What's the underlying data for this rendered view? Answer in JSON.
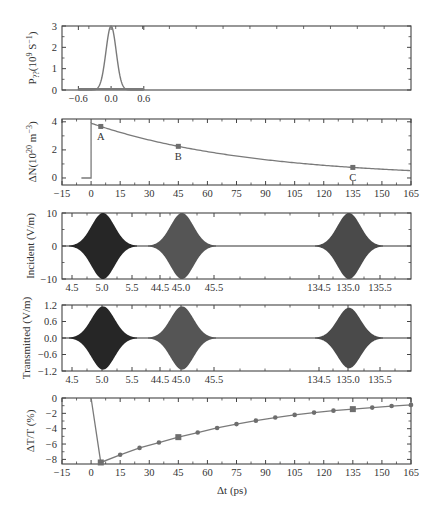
{
  "figure": {
    "xlabel": "Δt (ps)",
    "colors": {
      "axis": "#444444",
      "curve": "#7a7a7a",
      "marker": "#6e6e6e",
      "pulse1": "#262626",
      "pulse2": "#555555",
      "pulse3": "#4a4a4a"
    }
  },
  "chart_data": [
    {
      "id": "pump",
      "type": "line",
      "ylabel": "P_?? (10^9 S^-1)",
      "ylabel_main": "P",
      "ylabel_sub": "??",
      "ylabel_rest": "(10",
      "ylabel_sup1": "9",
      "ylabel_rest2": " S",
      "ylabel_sup2": "−1",
      "ylabel_end": ")",
      "xlim": [
        -0.9,
        5.5
      ],
      "ylim": [
        0,
        3
      ],
      "xticks": [
        -0.6,
        0.0,
        0.6
      ],
      "xtick_labels": [
        "−0.6",
        "0.0",
        "0.6"
      ],
      "yticks": [
        0,
        1,
        2,
        3
      ],
      "ytick_labels": [
        "0",
        "1",
        "2",
        "3"
      ],
      "series": [
        {
          "name": "pump pulse (gaussian)",
          "center": 0.0,
          "peak": 3.0,
          "fwhm": 0.22,
          "x_range": [
            -0.6,
            0.6
          ]
        }
      ]
    },
    {
      "id": "carrier",
      "type": "line",
      "ylabel": "ΔN(10^20 m^-3)",
      "xlim": [
        -15,
        165
      ],
      "ylim": [
        -0.5,
        4.2
      ],
      "xticks": [
        -15,
        0,
        15,
        30,
        45,
        60,
        75,
        90,
        105,
        120,
        135,
        150,
        165
      ],
      "yticks": [
        0,
        2,
        4
      ],
      "series": [
        {
          "name": "ΔN",
          "x": [
            -5,
            0,
            0,
            5,
            15,
            30,
            45,
            60,
            75,
            90,
            105,
            120,
            135,
            150,
            165
          ],
          "y": [
            0,
            0,
            3.9,
            3.7,
            3.35,
            2.8,
            2.3,
            1.9,
            1.6,
            1.35,
            1.12,
            0.93,
            0.77,
            0.66,
            0.57
          ]
        }
      ],
      "annotations": [
        {
          "label": "A",
          "x": 5,
          "y": 3.7
        },
        {
          "label": "B",
          "x": 45,
          "y": 2.3
        },
        {
          "label": "C",
          "x": 135,
          "y": 0.77
        }
      ]
    },
    {
      "id": "incident",
      "type": "line",
      "ylabel": "Incident (V/m)",
      "ylim": [
        -10,
        10
      ],
      "yticks": [
        -10,
        0,
        10
      ],
      "ytick_labels": [
        "−10",
        "0",
        "10"
      ],
      "xtick_labels": [
        "4.5",
        "5.0",
        "5.5",
        "44.5",
        "45.0",
        "45.5",
        "134.5",
        "135.0",
        "135.5"
      ],
      "pulses": [
        {
          "center": 5.0,
          "amplitude": 10
        },
        {
          "center": 45.0,
          "amplitude": 10
        },
        {
          "center": 135.0,
          "amplitude": 10
        }
      ]
    },
    {
      "id": "transmitted",
      "type": "line",
      "ylabel": "Transmitted (V/m)",
      "ylim": [
        -1.2,
        1.2
      ],
      "yticks": [
        -1.2,
        -0.6,
        0.0,
        0.6,
        1.2
      ],
      "ytick_labels": [
        "−1.2",
        "−0.6",
        "0.0",
        "0.6",
        "1.2"
      ],
      "xtick_labels": [
        "4.5",
        "5.0",
        "5.5",
        "44.5",
        "45.0",
        "45.5",
        "134.5",
        "135.0",
        "135.5"
      ],
      "pulses": [
        {
          "center": 5.0,
          "amplitude": 1.15
        },
        {
          "center": 45.0,
          "amplitude": 1.15
        },
        {
          "center": 135.0,
          "amplitude": 1.1
        }
      ]
    },
    {
      "id": "dtt",
      "type": "line",
      "ylabel": "ΔT/T (%)",
      "xlabel": "Δt (ps)",
      "xlim": [
        -15,
        165
      ],
      "ylim": [
        -8.6,
        0
      ],
      "xticks": [
        -15,
        0,
        15,
        30,
        45,
        60,
        75,
        90,
        105,
        120,
        135,
        150,
        165
      ],
      "yticks": [
        -8,
        -6,
        -4,
        -2,
        0
      ],
      "ytick_labels": [
        "−8",
        "−6",
        "−4",
        "−2",
        "0"
      ],
      "series": [
        {
          "name": "ΔT/T",
          "x": [
            0,
            5,
            15,
            25,
            35,
            45,
            55,
            65,
            75,
            85,
            95,
            105,
            115,
            125,
            135,
            145,
            155,
            165
          ],
          "y": [
            0,
            -8.4,
            -7.4,
            -6.5,
            -5.8,
            -5.1,
            -4.5,
            -3.9,
            -3.4,
            -2.95,
            -2.55,
            -2.2,
            -1.9,
            -1.65,
            -1.45,
            -1.25,
            -1.05,
            -0.9
          ]
        }
      ],
      "highlighted_points": [
        5,
        45,
        135
      ]
    }
  ]
}
